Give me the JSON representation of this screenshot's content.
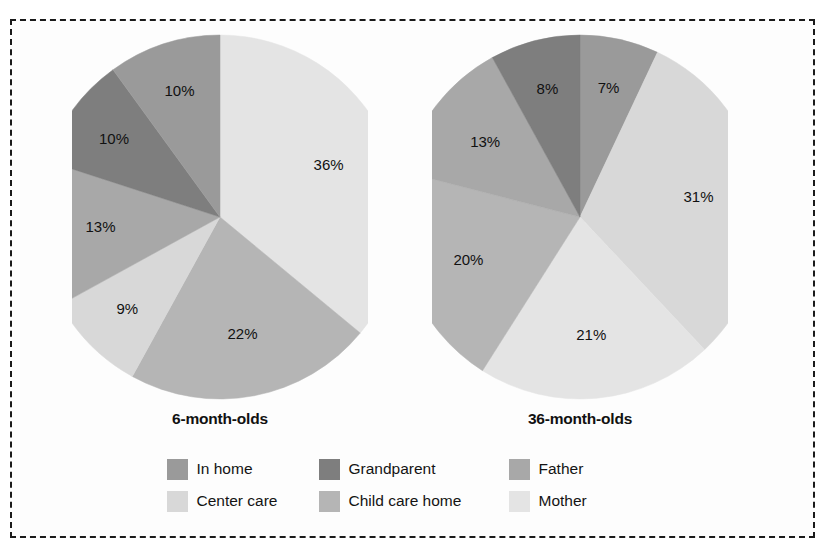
{
  "figure": {
    "border_style": "dashed",
    "border_color": "#1a1a1a",
    "background": "#fdfdfd"
  },
  "palette": {
    "in_home": "#9a9a9a",
    "center_care": "#d8d8d8",
    "grandparent": "#7e7e7e",
    "child_care_home": "#b5b5b5",
    "father": "#a8a8a8",
    "mother": "#e4e4e4"
  },
  "legend": {
    "items": [
      {
        "key": "in_home",
        "label": "In home",
        "color": "#9a9a9a"
      },
      {
        "key": "grandparent",
        "label": "Grandparent",
        "color": "#7e7e7e"
      },
      {
        "key": "father",
        "label": "Father",
        "color": "#a8a8a8"
      },
      {
        "key": "center_care",
        "label": "Center care",
        "color": "#d8d8d8"
      },
      {
        "key": "child_care_home",
        "label": "Child care home",
        "color": "#b5b5b5"
      },
      {
        "key": "mother",
        "label": "Mother",
        "color": "#e4e4e4"
      }
    ]
  },
  "chart_data": [
    {
      "type": "pie",
      "title": "6-month-olds",
      "categories": [
        "Mother",
        "Child care home",
        "Center care",
        "Father",
        "Grandparent",
        "In home"
      ],
      "values": [
        36,
        22,
        9,
        13,
        10,
        10
      ],
      "labels": [
        "36%",
        "22%",
        "9%",
        "13%",
        "10%",
        "10%"
      ],
      "colors": [
        "#e4e4e4",
        "#b5b5b5",
        "#d8d8d8",
        "#a8a8a8",
        "#7e7e7e",
        "#9a9a9a"
      ],
      "start_angle_deg": 0,
      "direction": "clockwise",
      "legend_position": "bottom-center"
    },
    {
      "type": "pie",
      "title": "36-month-olds",
      "categories": [
        "In home",
        "Center care",
        "Mother",
        "Child care home",
        "Father",
        "Grandparent"
      ],
      "values": [
        7,
        31,
        21,
        20,
        13,
        8
      ],
      "labels": [
        "7%",
        "31%",
        "21%",
        "20%",
        "13%",
        "8%"
      ],
      "colors": [
        "#9a9a9a",
        "#d8d8d8",
        "#e4e4e4",
        "#b5b5b5",
        "#a8a8a8",
        "#7e7e7e"
      ],
      "start_angle_deg": 0,
      "direction": "clockwise",
      "legend_position": "bottom-center"
    }
  ]
}
